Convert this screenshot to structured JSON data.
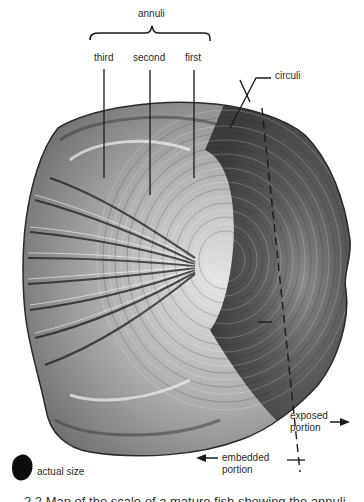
{
  "figure": {
    "labels": {
      "annuli": "annuli",
      "third": "third",
      "second": "second",
      "first": "first",
      "circuli": "circuli",
      "exposed_line1": "exposed",
      "exposed_line2": "portion",
      "embedded_line1": "embedded",
      "embedded_line2": "portion",
      "actual_size": "actual size"
    },
    "caption": "2.2  Map of the scale of a mature fish showing the annuli",
    "colors": {
      "ink": "#1a1a1a",
      "scale_dark": "#3a3a3a",
      "scale_mid": "#7a7a7a",
      "scale_light": "#d8d8d8",
      "background": "#ffffff"
    }
  }
}
